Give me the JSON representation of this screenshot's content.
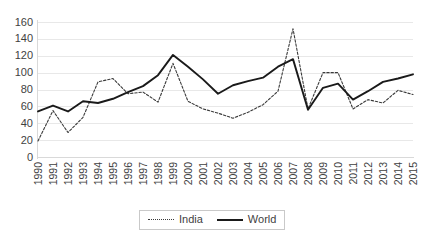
{
  "chart_data": {
    "type": "line",
    "title": "",
    "subtitle": "",
    "xlabel": "",
    "ylabel": "",
    "categories": [
      "1990",
      "1991",
      "1992",
      "1993",
      "1994",
      "1995",
      "1996",
      "1997",
      "1998",
      "1999",
      "2000",
      "2001",
      "2002",
      "2003",
      "2004",
      "2005",
      "2006",
      "2007",
      "2008",
      "2009",
      "2010",
      "2011",
      "2012",
      "2013",
      "2014",
      "2015"
    ],
    "series": [
      {
        "name": "India",
        "style": "dotted",
        "color": "#3a3a3a",
        "values": [
          19,
          55,
          29,
          47,
          89,
          93,
          75,
          77,
          65,
          111,
          66,
          57,
          52,
          46,
          53,
          62,
          78,
          152,
          57,
          100,
          100,
          57,
          68,
          64,
          79,
          74
        ]
      },
      {
        "name": "World",
        "style": "solid",
        "color": "#1a1a1a",
        "values": [
          54,
          61,
          54,
          66,
          64,
          69,
          77,
          84,
          97,
          121,
          107,
          92,
          75,
          85,
          90,
          94,
          107,
          116,
          56,
          82,
          87,
          68,
          78,
          89,
          93,
          98
        ]
      }
    ],
    "ylim": [
      0,
      160
    ],
    "yticks": [
      0,
      20,
      40,
      60,
      80,
      100,
      120,
      140,
      160
    ],
    "ytick_labels": [
      "0",
      "20",
      "40",
      "60",
      "80",
      "100",
      "120",
      "140",
      "160"
    ],
    "grid": true,
    "grid_color": "#e8e8e8",
    "legend_position": "bottom",
    "legend_entries": [
      "India",
      "World"
    ],
    "annotations": []
  }
}
